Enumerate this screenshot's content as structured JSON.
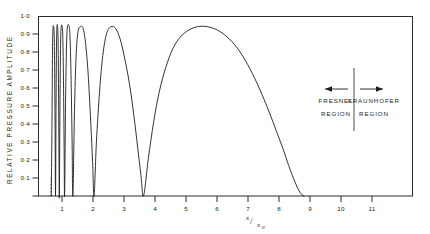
{
  "chart_data": {
    "type": "line",
    "title": "",
    "subtitle": "",
    "xlabel": "x/x₀",
    "ylabel": "RELATIVE PRESSURE AMPLITUDE",
    "xlim": [
      0,
      11.75
    ],
    "ylim": [
      0,
      1.06
    ],
    "grid": false,
    "legend_position": "none",
    "x_ticks": [
      1,
      2,
      3,
      4,
      5,
      6,
      7,
      8,
      9,
      10,
      11
    ],
    "x_tick_labels": [
      "1",
      "2",
      "3",
      "4",
      "5",
      "6",
      "7",
      "8",
      "9",
      "10",
      "11"
    ],
    "y_ticks": [
      0.1,
      0.2,
      0.3,
      0.4,
      0.5,
      0.6,
      0.7,
      0.8,
      0.9,
      1.0
    ],
    "y_tick_labels": [
      "0·1",
      "0·2",
      "0·3",
      "0·4",
      "0·5",
      "0·6",
      "0·7",
      "0·8",
      "0·9",
      "1·0"
    ],
    "series": [
      {
        "name": "axial pressure amplitude",
        "style": "solid",
        "maxima_x": [
          0.52,
          0.68,
          0.9,
          1.32,
          2.25,
          3.3,
          9.7
        ],
        "maxima_y": [
          1.0,
          1.0,
          1.0,
          1.0,
          1.0,
          1.0,
          1.0
        ],
        "minima_x": [
          0.6,
          0.78,
          1.05,
          1.62,
          2.7,
          5.0
        ],
        "minima_y": [
          0.0,
          0.0,
          0.0,
          0.0,
          0.0,
          0.0
        ],
        "points": [
          [
            0.4,
            0.0
          ],
          [
            0.425,
            0.45
          ],
          [
            0.44,
            0.85
          ],
          [
            0.455,
            0.99
          ],
          [
            0.47,
            1.0
          ],
          [
            0.49,
            0.97
          ],
          [
            0.505,
            0.8
          ],
          [
            0.52,
            0.45
          ],
          [
            0.535,
            0.0
          ],
          [
            0.55,
            0.5
          ],
          [
            0.565,
            0.88
          ],
          [
            0.58,
            1.0
          ],
          [
            0.6,
            1.0
          ],
          [
            0.615,
            0.92
          ],
          [
            0.63,
            0.62
          ],
          [
            0.645,
            0.2
          ],
          [
            0.655,
            0.0
          ],
          [
            0.675,
            0.55
          ],
          [
            0.695,
            0.9
          ],
          [
            0.715,
            1.0
          ],
          [
            0.745,
            1.0
          ],
          [
            0.765,
            0.93
          ],
          [
            0.785,
            0.68
          ],
          [
            0.805,
            0.28
          ],
          [
            0.82,
            0.0
          ],
          [
            0.85,
            0.55
          ],
          [
            0.88,
            0.88
          ],
          [
            0.91,
            1.0
          ],
          [
            0.965,
            1.0
          ],
          [
            0.995,
            0.92
          ],
          [
            1.025,
            0.68
          ],
          [
            1.055,
            0.33
          ],
          [
            1.08,
            0.0
          ],
          [
            1.13,
            0.5
          ],
          [
            1.18,
            0.82
          ],
          [
            1.24,
            0.97
          ],
          [
            1.32,
            1.0
          ],
          [
            1.4,
            0.99
          ],
          [
            1.48,
            0.9
          ],
          [
            1.56,
            0.72
          ],
          [
            1.64,
            0.44
          ],
          [
            1.7,
            0.2
          ],
          [
            1.745,
            0.0
          ],
          [
            1.82,
            0.32
          ],
          [
            1.92,
            0.62
          ],
          [
            2.02,
            0.83
          ],
          [
            2.14,
            0.96
          ],
          [
            2.28,
            1.0
          ],
          [
            2.42,
            0.99
          ],
          [
            2.56,
            0.93
          ],
          [
            2.7,
            0.82
          ],
          [
            2.86,
            0.66
          ],
          [
            3.0,
            0.47
          ],
          [
            3.12,
            0.28
          ],
          [
            3.22,
            0.12
          ],
          [
            3.3,
            0.0
          ],
          [
            3.45,
            0.22
          ],
          [
            3.62,
            0.44
          ],
          [
            3.8,
            0.62
          ],
          [
            4.0,
            0.76
          ],
          [
            4.22,
            0.87
          ],
          [
            4.46,
            0.94
          ],
          [
            4.72,
            0.98
          ],
          [
            5.0,
            1.0
          ],
          [
            5.3,
            1.0
          ],
          [
            5.62,
            0.98
          ],
          [
            5.92,
            0.94
          ],
          [
            6.22,
            0.88
          ],
          [
            6.5,
            0.8
          ],
          [
            6.78,
            0.7
          ],
          [
            7.02,
            0.6
          ],
          [
            7.26,
            0.49
          ],
          [
            7.48,
            0.38
          ],
          [
            7.68,
            0.28
          ],
          [
            7.86,
            0.18
          ],
          [
            8.02,
            0.1
          ],
          [
            8.16,
            0.04
          ],
          [
            8.26,
            0.01
          ],
          [
            8.34,
            0.0
          ]
        ]
      },
      {
        "name": "low-amplitude onset",
        "style": "dashed",
        "points": [
          [
            0.4,
            0.0
          ],
          [
            0.4,
            0.12
          ]
        ]
      }
    ],
    "annotations": [
      {
        "name": "fresnel-region",
        "line1": "FRESNEL",
        "line2": "REGION",
        "arrow": "left"
      },
      {
        "name": "fraunhofer-region",
        "line1": "FRAUNHOFER",
        "line2": "REGION",
        "arrow": "right"
      }
    ],
    "divider": {
      "label": "region-boundary",
      "x_value": 9.4
    }
  },
  "colors": {
    "background": "#ffffff",
    "axis": "#2b2b2b",
    "curve": "#1c1c1c",
    "text": "#1c1c1c"
  }
}
